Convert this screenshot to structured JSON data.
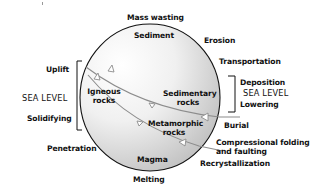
{
  "diagram": {
    "circle": {
      "cx": 150,
      "cy": 97.5,
      "rx": 70,
      "ry": 73.5,
      "fill_light": "#ffffff",
      "fill_dark": "#bdbdbd",
      "stroke": "#111111"
    },
    "inner_labels": {
      "sediment": "Sediment",
      "igneous": [
        "Igneous",
        "rocks"
      ],
      "sedimentary": [
        "Sedimentary",
        "rocks"
      ],
      "metamorphic": [
        "Metamorphic",
        "rocks"
      ],
      "magma": "Magma"
    },
    "outer_labels": {
      "mass_wasting": "Mass wasting",
      "erosion": "Erosion",
      "transportation": "Transportation",
      "deposition": "Deposition",
      "sea_level_right": "SEA LEVEL",
      "lowering": "Lowering",
      "burial": "Burial",
      "compressional": [
        "Compressional folding",
        "and faulting"
      ],
      "recrystallization": "Recrystallization",
      "melting": "Melting",
      "penetration": "Penetration",
      "solidifying": "Solidifying",
      "sea_level_left": "SEA LEVEL",
      "uplift": "Uplift"
    },
    "line_color": "#8c8c8c",
    "arrow_fill": "#ffffff"
  }
}
